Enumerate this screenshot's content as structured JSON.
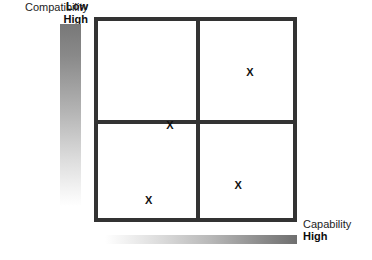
{
  "y_axis": {
    "name": "Compatibility",
    "high_label": "High",
    "low_label": "Low",
    "gradient_high_color": "#787878",
    "gradient_low_color": "#ffffff"
  },
  "x_axis": {
    "name": "Capability",
    "high_label": "High",
    "gradient_low_color": "#ffffff",
    "gradient_high_color": "#6f6f6f"
  },
  "matrix": {
    "border_color": "#333333",
    "background_color": "#ffffff",
    "quadrants": [
      {
        "id": "top-left",
        "position": "high-compatibility-low-capability"
      },
      {
        "id": "top-right",
        "position": "high-compatibility-high-capability"
      },
      {
        "id": "bottom-left",
        "position": "low-compatibility-low-capability"
      },
      {
        "id": "bottom-right",
        "position": "low-compatibility-high-capability"
      }
    ]
  },
  "marks": [
    {
      "label": "X",
      "quadrant": "top-left",
      "left_pct": 37,
      "top_pct": 53
    },
    {
      "label": "X",
      "quadrant": "top-right",
      "left_pct": 78,
      "top_pct": 26
    },
    {
      "label": "X",
      "quadrant": "bottom-left",
      "left_pct": 26,
      "top_pct": 91
    },
    {
      "label": "X",
      "quadrant": "bottom-right",
      "left_pct": 72,
      "top_pct": 83
    }
  ],
  "chart_data": {
    "type": "scatter",
    "title": "",
    "xlabel": "Capability",
    "ylabel": "Compatibility",
    "xlim": [
      "Low",
      "High"
    ],
    "ylim": [
      "Low",
      "High"
    ],
    "grid": true,
    "legend": "none",
    "quadrant_count": 4,
    "points": [
      {
        "label": "X",
        "x_qualitative": "low",
        "y_qualitative": "high",
        "x": 0.18,
        "y": 0.74
      },
      {
        "label": "X",
        "x_qualitative": "high",
        "y_qualitative": "high",
        "x": 0.86,
        "y": 0.88
      },
      {
        "label": "X",
        "x_qualitative": "low",
        "y_qualitative": "low",
        "x": 0.12,
        "y": 0.09
      },
      {
        "label": "X",
        "x_qualitative": "high",
        "y_qualitative": "low",
        "x": 0.84,
        "y": 0.17
      }
    ]
  }
}
